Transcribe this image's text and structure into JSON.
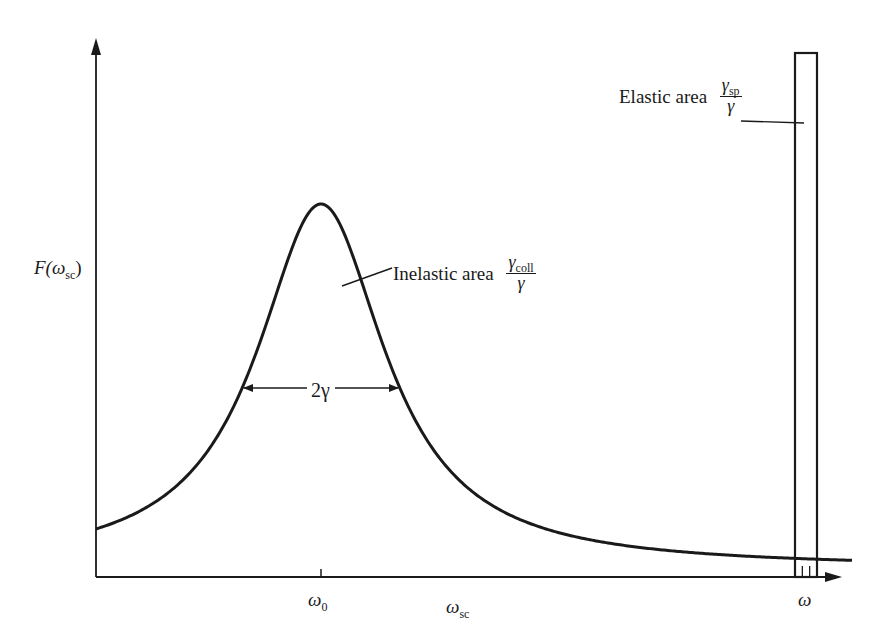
{
  "chart_data": {
    "type": "line",
    "title": "",
    "xlabel": "ω_sc",
    "ylabel": "F(ω_sc)",
    "grid": false,
    "legend": null,
    "x_ticks": [
      {
        "label": "ω_0",
        "pos": "center of inelastic peak"
      },
      {
        "label": "ω",
        "pos": "location of elastic spike"
      }
    ],
    "series": [
      {
        "name": "Inelastic (Lorentzian) component",
        "shape": "lorentzian",
        "center": "ω_0",
        "full_width_half_max": "2γ",
        "area": "γ_coll / γ",
        "relative_peak_height": 0.73
      },
      {
        "name": "Elastic component",
        "shape": "narrow spike (delta-like)",
        "center": "ω",
        "area": "γ_sp / γ",
        "relative_peak_height": 1.0
      }
    ],
    "annotations": [
      {
        "text": "Inelastic area γ_coll/γ",
        "points_to": "inelastic peak"
      },
      {
        "text": "Elastic area γ_sp/γ",
        "points_to": "elastic spike"
      },
      {
        "text": "2γ",
        "type": "double-headed arrow",
        "meaning": "full width at half maximum"
      }
    ]
  },
  "labels": {
    "y_axis": {
      "main": "F(ω",
      "sub": "sc",
      "close": ")"
    },
    "x_axis": {
      "main": "ω",
      "sub": "sc"
    },
    "tick_omega0": {
      "main": "ω",
      "sub": "0"
    },
    "tick_omega": "ω",
    "width_label": "2γ",
    "inelastic": {
      "text": "Inelastic area",
      "num_main": "γ",
      "num_sub": "coll",
      "den": "γ"
    },
    "elastic": {
      "text": "Elastic area",
      "num_main": "γ",
      "num_sub": "sp",
      "den": "γ"
    }
  },
  "geometry": {
    "origin_x": 96,
    "axis_y": 577,
    "axis_top": 38,
    "axis_right": 842,
    "peak_x": 321,
    "peak_y": 204,
    "baseline_y": 568,
    "half_width_px": 78,
    "spike_left": 795,
    "spike_right": 817,
    "spike_top": 53,
    "ink": "#1a1a1a"
  }
}
